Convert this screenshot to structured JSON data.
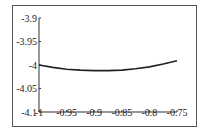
{
  "chart_data": {
    "type": "line",
    "title": "",
    "xlabel": "",
    "ylabel": "",
    "xlim": [
      -1,
      -0.75
    ],
    "ylim": [
      -4.1,
      -3.9
    ],
    "x_ticks": [
      "-1",
      "-0.95",
      "-0.9",
      "-0.85",
      "-0.8",
      "-0.75"
    ],
    "y_ticks": [
      "-3.9",
      "-3.95",
      "-4",
      "-4.05",
      "-4.1"
    ],
    "grid": false,
    "legend": null,
    "series": [
      {
        "name": "curve",
        "color": "#222222",
        "x": [
          -1.0,
          -0.975,
          -0.95,
          -0.925,
          -0.9,
          -0.875,
          -0.85,
          -0.825,
          -0.8,
          -0.775,
          -0.75
        ],
        "y": [
          -4.0,
          -4.005,
          -4.009,
          -4.011,
          -4.012,
          -4.012,
          -4.011,
          -4.008,
          -4.004,
          -3.998,
          -3.991
        ]
      }
    ]
  },
  "colors": {
    "axis": "#333333",
    "frame": "#555555",
    "line": "#222222"
  }
}
